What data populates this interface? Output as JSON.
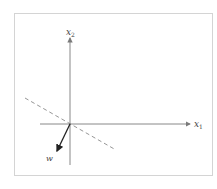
{
  "diagram": {
    "axes": {
      "x_label": "x",
      "x_subscript": "1",
      "y_label": "x",
      "y_subscript": "2"
    },
    "vector": {
      "label": "w"
    },
    "colors": {
      "axis": "#7a7a7a",
      "vector": "#222222",
      "dashed_line": "#8a8a8a",
      "frame": "#d4d4d4"
    }
  }
}
